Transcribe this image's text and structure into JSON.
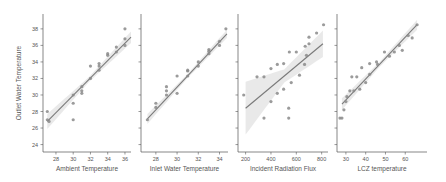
{
  "chart_data": [
    {
      "type": "scatter",
      "title": "",
      "xlabel": "Ambient Temperature",
      "ylabel": "Outlet Water Temperature",
      "xlim": [
        26.5,
        36.7
      ],
      "ylim": [
        23.1,
        39.8
      ],
      "xticks": [
        28,
        30,
        32,
        34,
        36
      ],
      "yticks": [
        24,
        26,
        28,
        30,
        32,
        34,
        36,
        38
      ],
      "grid": false,
      "regression": {
        "x0": 27,
        "y0": 26.8,
        "x1": 36.7,
        "y1": 37.0,
        "ci_width": [
          0.9,
          0.3,
          0.7
        ]
      },
      "points": [
        [
          27,
          28
        ],
        [
          27,
          27
        ],
        [
          27.2,
          26.8
        ],
        [
          30,
          29
        ],
        [
          30,
          27
        ],
        [
          30,
          30
        ],
        [
          31,
          30.2
        ],
        [
          31,
          30.5
        ],
        [
          31,
          31
        ],
        [
          32,
          32
        ],
        [
          32,
          33.5
        ],
        [
          33,
          33
        ],
        [
          33,
          33.5
        ],
        [
          33,
          33.8
        ],
        [
          34,
          35
        ],
        [
          34,
          34.8
        ],
        [
          35,
          35.2
        ],
        [
          35,
          35.8
        ],
        [
          36,
          36
        ],
        [
          36,
          36.8
        ],
        [
          36,
          38
        ]
      ]
    },
    {
      "type": "scatter",
      "title": "",
      "xlabel": "Inlet Water Temperature",
      "ylabel": "",
      "xlim": [
        26.6,
        34.8
      ],
      "ylim": [
        23.1,
        39.8
      ],
      "xticks": [
        28,
        30,
        32,
        34
      ],
      "yticks": [
        24,
        26,
        28,
        30,
        32,
        34,
        36,
        38
      ],
      "grid": false,
      "regression": {
        "x0": 27.2,
        "y0": 27.1,
        "x1": 34.7,
        "y1": 37.4,
        "ci_width": [
          0.6,
          0.25,
          0.5
        ]
      },
      "points": [
        [
          27.2,
          27
        ],
        [
          28,
          28.5
        ],
        [
          28,
          29
        ],
        [
          29,
          30
        ],
        [
          29,
          30.5
        ],
        [
          29,
          31
        ],
        [
          30,
          32.3
        ],
        [
          30,
          30.2
        ],
        [
          31,
          33
        ],
        [
          31,
          32.3
        ],
        [
          31,
          32.9
        ],
        [
          32,
          34
        ],
        [
          32,
          33.5
        ],
        [
          33,
          35
        ],
        [
          33,
          35.3
        ],
        [
          33,
          35.5
        ],
        [
          34,
          36
        ],
        [
          34,
          36.5
        ],
        [
          34.6,
          38
        ]
      ]
    },
    {
      "type": "scatter",
      "title": "",
      "xlabel": "Incident Radiation Flux",
      "ylabel": "",
      "xlim": [
        140,
        850
      ],
      "ylim": [
        23.1,
        39.8
      ],
      "xticks": [
        200,
        400,
        600,
        800
      ],
      "yticks": [
        24,
        26,
        28,
        30,
        32,
        34,
        36,
        38
      ],
      "grid": false,
      "regression": {
        "x0": 200,
        "y0": 28.4,
        "x1": 810,
        "y1": 36.2,
        "ci_width": [
          3.2,
          0.8,
          1.6
        ]
      },
      "points": [
        [
          185,
          30
        ],
        [
          290,
          32.2
        ],
        [
          345,
          32.2
        ],
        [
          400,
          33.2
        ],
        [
          450,
          33.7
        ],
        [
          500,
          33.8
        ],
        [
          545,
          35.2
        ],
        [
          600,
          35.2
        ],
        [
          670,
          35.9
        ],
        [
          700,
          36.2
        ],
        [
          700,
          37
        ],
        [
          760,
          37.5
        ],
        [
          815,
          38.5
        ],
        [
          345,
          27.2
        ],
        [
          400,
          29.2
        ],
        [
          450,
          30.2
        ],
        [
          500,
          30.7
        ],
        [
          540,
          28.4
        ],
        [
          540,
          27.2
        ],
        [
          560,
          31.5
        ],
        [
          625,
          32.4
        ],
        [
          665,
          33.7
        ],
        [
          680,
          34.8
        ]
      ]
    },
    {
      "type": "scatter",
      "title": "",
      "xlabel": "LCZ temperature",
      "ylabel": "",
      "xlim": [
        25.5,
        71
      ],
      "ylim": [
        23.1,
        39.8
      ],
      "xticks": [
        30,
        40,
        50,
        60
      ],
      "yticks": [
        24,
        26,
        28,
        30,
        32,
        34,
        36,
        38
      ],
      "grid": false,
      "regression": {
        "x0": 28,
        "y0": 28.9,
        "x1": 66,
        "y1": 38.5,
        "ci_width": [
          0.7,
          0.3,
          0.6
        ]
      },
      "points": [
        [
          27,
          27.2
        ],
        [
          28,
          27.2
        ],
        [
          29,
          28.2
        ],
        [
          30,
          29.2
        ],
        [
          30.5,
          29.8
        ],
        [
          32,
          30.5
        ],
        [
          33,
          32.2
        ],
        [
          34,
          30.5
        ],
        [
          35.5,
          32.2
        ],
        [
          37,
          30.7
        ],
        [
          38,
          33.3
        ],
        [
          40,
          31.5
        ],
        [
          42,
          32.5
        ],
        [
          42,
          33.8
        ],
        [
          45.5,
          34
        ],
        [
          46,
          33.7
        ],
        [
          49.5,
          35.2
        ],
        [
          52,
          34.7
        ],
        [
          54.5,
          35.2
        ],
        [
          57,
          36
        ],
        [
          58.5,
          35.4
        ],
        [
          61.5,
          37.2
        ],
        [
          63.5,
          36.9
        ],
        [
          66,
          38.5
        ]
      ]
    }
  ],
  "style": {
    "point_color": "#8a8a8a",
    "line_color": "#7a7a7a",
    "ci_color": "#e3e3e3",
    "axis_color": "#555555"
  },
  "layout": {
    "panels": [
      {
        "left": 43,
        "right": 131,
        "top": 14,
        "bottom": 152
      },
      {
        "left": 141,
        "right": 228,
        "top": 14,
        "bottom": 152
      },
      {
        "left": 238,
        "right": 328,
        "top": 14,
        "bottom": 152
      },
      {
        "left": 337,
        "right": 427,
        "top": 14,
        "bottom": 152
      }
    ]
  }
}
